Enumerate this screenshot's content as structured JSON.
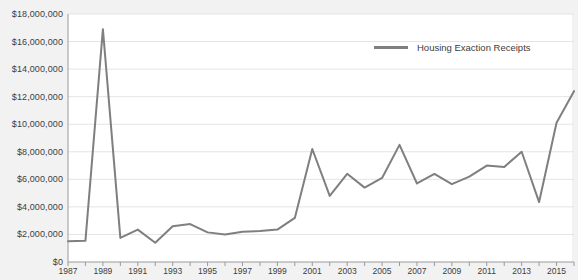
{
  "chart_data": {
    "type": "line",
    "title": "",
    "xlabel": "",
    "ylabel": "",
    "grid": true,
    "legend_position": "top-right",
    "series": [
      {
        "name": "Housing Exaction Receipts",
        "color": "#7f7f7f",
        "x": [
          1987,
          1988,
          1989,
          1990,
          1991,
          1992,
          1993,
          1994,
          1995,
          1996,
          1997,
          1998,
          1999,
          2000,
          2001,
          2002,
          2003,
          2004,
          2005,
          2006,
          2007,
          2008,
          2009,
          2010,
          2011,
          2012,
          2013,
          2014,
          2015,
          2016
        ],
        "values": [
          1500000,
          1550000,
          16900000,
          1750000,
          2350000,
          1400000,
          2600000,
          2750000,
          2150000,
          2000000,
          2200000,
          2250000,
          2350000,
          3200000,
          8200000,
          4800000,
          6400000,
          5400000,
          6100000,
          8500000,
          5700000,
          6400000,
          5650000,
          6200000,
          7000000,
          6900000,
          8000000,
          4350000,
          10100000,
          12400000
        ]
      }
    ],
    "x_ticks_labeled": [
      1987,
      1989,
      1991,
      1993,
      1995,
      1997,
      1999,
      2001,
      2003,
      2005,
      2007,
      2009,
      2011,
      2013,
      2015
    ],
    "x_tick_labels": [
      "1987",
      "1989",
      "1991",
      "1993",
      "1995",
      "1997",
      "1999",
      "2001",
      "2003",
      "2005",
      "2007",
      "2009",
      "2011",
      "2013",
      "2015"
    ],
    "xlim": [
      1987,
      2016
    ],
    "y_ticks": [
      0,
      2000000,
      4000000,
      6000000,
      8000000,
      10000000,
      12000000,
      14000000,
      16000000,
      18000000
    ],
    "y_tick_labels": [
      "$0",
      "$2,000,000",
      "$4,000,000",
      "$6,000,000",
      "$8,000,000",
      "$10,000,000",
      "$12,000,000",
      "$14,000,000",
      "$16,000,000",
      "$18,000,000"
    ],
    "ylim": [
      0,
      18000000
    ]
  },
  "legend": {
    "items": [
      {
        "label": "Housing Exaction Receipts",
        "color": "#7f7f7f"
      }
    ]
  },
  "colors": {
    "background": "#f2f2f2",
    "plot_background": "#ffffff",
    "series": "#7f7f7f",
    "grid": "#e4e4e4",
    "axis": "#9a9a9a",
    "text": "#3d3d3d"
  }
}
